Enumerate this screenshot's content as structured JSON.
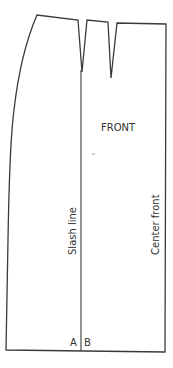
{
  "diagram": {
    "type": "sewing-pattern",
    "piece_label": "FRONT",
    "lines": {
      "slash_line": "Slash line",
      "center_front": "Center front"
    },
    "points": {
      "a": "A",
      "b": "B"
    },
    "colors": {
      "stroke": "#3a3a3a",
      "text": "#333333",
      "background": "#ffffff"
    }
  }
}
